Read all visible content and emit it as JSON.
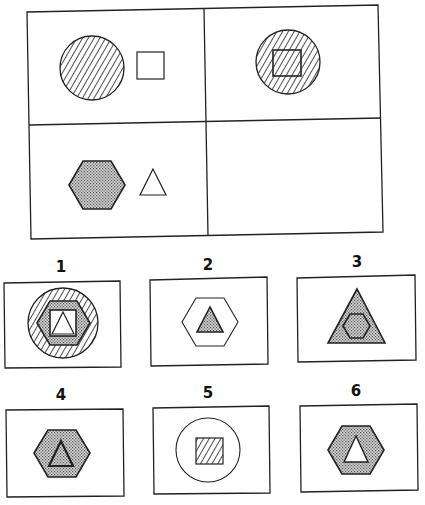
{
  "puzzle": {
    "type": "analogy-matrix",
    "grid": {
      "rows": 2,
      "cols": 2,
      "cells": [
        {
          "position": "top-left",
          "content": "hatched circle next to empty square"
        },
        {
          "position": "top-right",
          "content": "hatched circle containing hatched square"
        },
        {
          "position": "bottom-left",
          "content": "dotted hexagon next to empty triangle"
        },
        {
          "position": "bottom-right",
          "content": "empty (answer)"
        }
      ]
    },
    "options": [
      {
        "label": "1",
        "content": "hatched circle containing dotted hexagon containing square with triangle"
      },
      {
        "label": "2",
        "content": "empty hexagon containing dotted triangle"
      },
      {
        "label": "3",
        "content": "dotted triangle containing dotted hexagon"
      },
      {
        "label": "4",
        "content": "dotted hexagon containing dotted triangle"
      },
      {
        "label": "5",
        "content": "empty circle containing hatched square"
      },
      {
        "label": "6",
        "content": "dotted hexagon containing empty triangle"
      }
    ]
  },
  "colors": {
    "stroke": "#222222",
    "background": "#ffffff",
    "dot_fill": "#b8b8b8"
  }
}
